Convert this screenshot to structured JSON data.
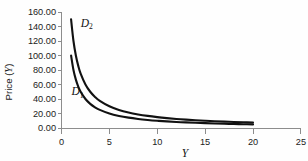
{
  "chart_data": {
    "type": "line",
    "title": "",
    "subtitle": "",
    "xlabel": "Y",
    "ylabel": "Price (Y)",
    "ylabel_prefix": "Price (",
    "ylabel_symbol": "Y",
    "ylabel_suffix": ")",
    "xlim": [
      0,
      25
    ],
    "ylim": [
      0,
      160
    ],
    "grid": false,
    "legend_position": "inline-annotation",
    "x_ticks": [
      0,
      5,
      10,
      15,
      20,
      25
    ],
    "x_tick_labels": [
      "0",
      "5",
      "10",
      "15",
      "20",
      "25"
    ],
    "y_ticks": [
      0,
      20,
      40,
      60,
      80,
      100,
      120,
      140,
      160
    ],
    "y_tick_labels": [
      "0.00",
      "20.00",
      "40.00",
      "60.00",
      "80.00",
      "100.00",
      "120.00",
      "140.00",
      "160.00"
    ],
    "series": [
      {
        "name": "D1",
        "label": "D",
        "subscript": "1",
        "color": "#111111",
        "relation": "P = 100 / Y",
        "x": [
          1,
          1.25,
          1.5,
          1.75,
          2,
          2.5,
          3,
          3.5,
          4,
          5,
          6,
          7,
          8,
          9,
          10,
          11,
          12,
          13,
          14,
          15,
          16,
          17,
          18,
          19,
          20
        ],
        "values": [
          100.0,
          80.0,
          66.67,
          57.14,
          50.0,
          40.0,
          33.33,
          28.57,
          25.0,
          20.0,
          16.67,
          14.29,
          12.5,
          11.11,
          10.0,
          9.09,
          8.33,
          7.69,
          7.14,
          6.67,
          6.25,
          5.88,
          5.56,
          5.26,
          5.0
        ],
        "label_at": {
          "x": 1.05,
          "y": 45.0
        }
      },
      {
        "name": "D2",
        "label": "D",
        "subscript": "2",
        "color": "#111111",
        "relation": "P = 150 / Y",
        "x": [
          1,
          1.25,
          1.5,
          1.75,
          2,
          2.5,
          3,
          3.5,
          4,
          5,
          6,
          7,
          8,
          9,
          10,
          11,
          12,
          13,
          14,
          15,
          16,
          17,
          18,
          19,
          20
        ],
        "values": [
          150.0,
          120.0,
          100.0,
          85.71,
          75.0,
          60.0,
          50.0,
          42.86,
          37.5,
          30.0,
          25.0,
          21.43,
          18.75,
          16.67,
          15.0,
          13.64,
          12.5,
          11.54,
          10.71,
          10.0,
          9.38,
          8.82,
          8.33,
          7.89,
          7.5
        ],
        "label_at": {
          "x": 2.0,
          "y": 140.0
        }
      }
    ],
    "colors": {
      "background": "#fefefe",
      "curve": "#111111",
      "axis": "#8d8d8d",
      "text": "#1b1b1b"
    }
  }
}
